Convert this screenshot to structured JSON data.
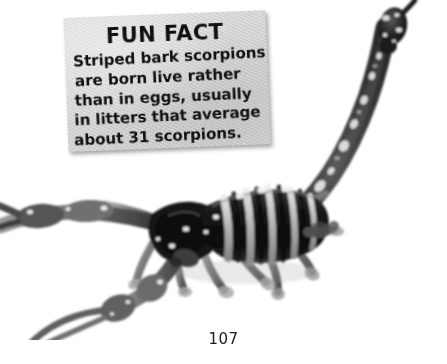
{
  "page": {
    "number": "107",
    "background_color": "#ffffff"
  },
  "fun_fact_card": {
    "title": "FUN FACT",
    "body_lines": [
      "Striped bark scorpions",
      "are born live rather",
      "than in eggs, usually",
      "in litters that average",
      "about 31 scorpions."
    ],
    "body_text": "Striped bark scorpions are born live rather than in eggs, usually in litters that average about 31 scorpions.",
    "card_color": "#d4d4d4",
    "text_color": "#111111"
  },
  "photo": {
    "subject": "striped bark scorpion",
    "description": "Black and white photograph of a striped bark scorpion with raised segmented tail and stinger, pincers extended to the left",
    "colors": {
      "body_dark": "#1a1a1a",
      "body_mid": "#6f6f6f",
      "body_light": "#cfcfcf",
      "highlight": "#f2f2f2",
      "background": "#ffffff"
    }
  }
}
